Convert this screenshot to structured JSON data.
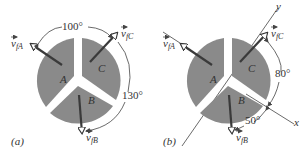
{
  "figure": {
    "panels": [
      {
        "id": "a",
        "caption": "(a)",
        "pieces": [
          "A",
          "B",
          "C"
        ],
        "vectors": {
          "A": "v",
          "A_sub": "fA",
          "B": "v",
          "B_sub": "fB",
          "C": "v",
          "C_sub": "fC"
        },
        "angles": [
          "100°",
          "130°"
        ]
      },
      {
        "id": "b",
        "caption": "(b)",
        "pieces": [
          "A",
          "B",
          "C"
        ],
        "vectors": {
          "A": "v",
          "A_sub": "fA",
          "B": "v",
          "B_sub": "fB",
          "C": "v",
          "C_sub": "fC"
        },
        "angles": [
          "80°",
          "50°"
        ],
        "axes": {
          "x": "x",
          "y": "y"
        }
      }
    ]
  },
  "colors": {
    "piece_fill": "#8a8a8a",
    "arrow": "#3a3a3a",
    "line": "#444444",
    "text": "#333333"
  }
}
